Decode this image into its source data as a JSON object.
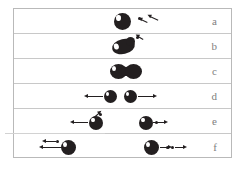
{
  "figure": {
    "type": "schematic-diagram",
    "panel_count": 6,
    "colors": {
      "nucleus": "#231f20",
      "highlight": "#ffffff",
      "frame": "#b9b9b9",
      "divider": "#c8c8c8",
      "label": "#7e7e7e",
      "background": "#ffffff"
    },
    "rows": [
      {
        "label": "a",
        "caption": "Spherical nucleus with incoming neutron",
        "objects": [
          {
            "kind": "nucleus",
            "shape": "sphere",
            "highlight": true
          },
          {
            "kind": "neutron",
            "count": 1,
            "arrow": "incoming-down-left"
          }
        ]
      },
      {
        "label": "b",
        "caption": "Nucleus absorbs neutron and deforms",
        "objects": [
          {
            "kind": "nucleus",
            "shape": "deformed-ellipse",
            "highlight": true
          },
          {
            "kind": "neutron",
            "count": 1,
            "arrow": "incoming-down-left"
          }
        ]
      },
      {
        "label": "c",
        "caption": "Elongated nucleus forms a neck",
        "objects": [
          {
            "kind": "nucleus",
            "shape": "peanut-necked",
            "highlight": true
          }
        ]
      },
      {
        "label": "d",
        "caption": "Scission: two fragments separate and recoil apart",
        "objects": [
          {
            "kind": "fragment",
            "side": "left",
            "arrow": "left"
          },
          {
            "kind": "fragment",
            "side": "right",
            "arrow": "right"
          }
        ]
      },
      {
        "label": "e",
        "caption": "Fragments fly apart, each emitting a prompt neutron",
        "objects": [
          {
            "kind": "fragment",
            "side": "left",
            "arrow": "left",
            "neutron": 1
          },
          {
            "kind": "fragment",
            "side": "right",
            "arrow": "right",
            "neutron": 1
          }
        ]
      },
      {
        "label": "f",
        "caption": "Fragments far apart with emitted neutrons travelling outward",
        "objects": [
          {
            "kind": "fragment",
            "side": "left",
            "arrow": "left",
            "neutron": 1
          },
          {
            "kind": "fragment",
            "side": "right",
            "arrow": "right",
            "neutron": 2
          }
        ]
      }
    ]
  }
}
